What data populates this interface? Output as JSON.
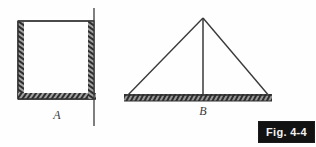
{
  "figure": {
    "caption": "Fig. 4-4",
    "background_color": "#fefefe",
    "ink_color": "#2e2e2e",
    "caption_background_color": "#121212",
    "caption_text_color": "#f2f2f2",
    "diagrams": [
      {
        "id": "A",
        "label": "A",
        "shape": "square-frame-with-hatched-supports",
        "description": "Square frame with hatched ground hatching on left, bottom and right edges; right vertical member extends above and below the square"
      },
      {
        "id": "B",
        "label": "B",
        "shape": "triangle-with-hatched-base",
        "description": "Triangle with hatched ground line along its base and a vertical center member from apex to base"
      }
    ]
  }
}
